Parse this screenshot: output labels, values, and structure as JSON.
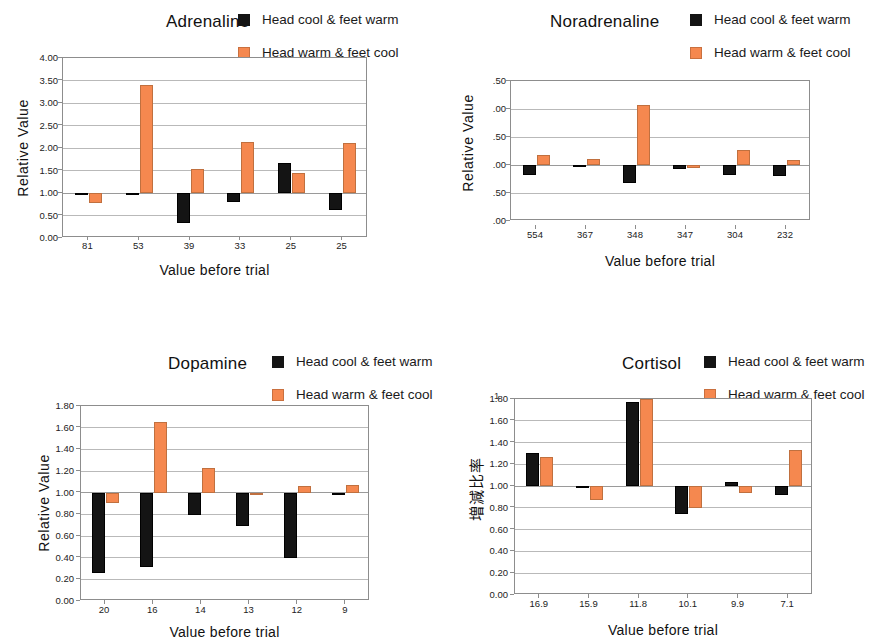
{
  "legend": {
    "series": [
      {
        "key": "dark",
        "label": "Head cool & feet warm",
        "color": "#141414"
      },
      {
        "key": "orange",
        "label": "Head warm & feet cool",
        "color": "#F5884F"
      }
    ]
  },
  "common": {
    "xlabel": "Value before trial",
    "ylabel_relative": "Relative Value",
    "ylabel_cortisol": "増減比率",
    "baseline_value": 1.0,
    "colors": {
      "dark": "#141414",
      "orange": "#F5884F",
      "grid": "#b9b9b9",
      "axis": "#8d8d8d",
      "background": "#ffffff"
    }
  },
  "panels": [
    {
      "id": "adrenaline",
      "title": "Adrenaline",
      "legend_truncated": true,
      "legend_labels": [
        "Head cool & feet warm",
        "Head warm & feet cool"
      ]
    },
    {
      "id": "noradrenaline",
      "title": "Noradrenaline",
      "legend_truncated": false,
      "legend_labels": [
        "Head cool & feet warm",
        "Head warm & feet cool"
      ]
    },
    {
      "id": "dopamine",
      "title": "Dopamine",
      "legend_truncated": true,
      "legend_labels": [
        "Head cool & feet warm",
        "Head warm & feet cool"
      ]
    },
    {
      "id": "cortisol",
      "title": "Cortisol",
      "legend_truncated": false,
      "legend_labels": [
        "Head cool & feet warm",
        "Head warm & feet cool"
      ]
    }
  ],
  "chart_data": [
    {
      "id": "adrenaline",
      "type": "bar",
      "title": "Adrenaline",
      "xlabel": "Value before trial",
      "ylabel": "Relative Value",
      "categories": [
        "81",
        "53",
        "39",
        "33",
        "25",
        "25"
      ],
      "ytick_labels": [
        "4.00",
        "3.50",
        "3.00",
        "2.50",
        "2.00",
        "1.50",
        "1.00",
        "0.50",
        "0.00"
      ],
      "ytick_values": [
        4.0,
        3.5,
        3.0,
        2.5,
        2.0,
        1.5,
        1.0,
        0.5,
        0.0
      ],
      "ylim": [
        0.0,
        4.0
      ],
      "baseline": 1.0,
      "grid": true,
      "legend_position": "top-right",
      "series": [
        {
          "name": "Head cool & feet warm",
          "color": "#141414",
          "values": [
            0.95,
            1.01,
            0.33,
            0.79,
            1.66,
            0.62
          ]
        },
        {
          "name": "Head warm & feet cool",
          "color": "#F5884F",
          "values": [
            0.77,
            3.4,
            1.53,
            2.14,
            1.44,
            2.11
          ]
        }
      ]
    },
    {
      "id": "noradrenaline",
      "type": "bar",
      "title": "Noradrenaline",
      "xlabel": "Value before trial",
      "ylabel": "Relative Value",
      "categories": [
        "554",
        "367",
        "348",
        "347",
        "304",
        "232"
      ],
      "ytick_labels": [
        ".50",
        ".00",
        ".50",
        ".00",
        ".50",
        ".00"
      ],
      "ytick_values": [
        2.5,
        2.0,
        1.5,
        1.0,
        0.5,
        0.0
      ],
      "ylim": [
        0.0,
        2.5
      ],
      "baseline": 1.0,
      "grid": true,
      "legend_position": "top-right",
      "series": [
        {
          "name": "Head cool & feet warm",
          "color": "#141414",
          "values": [
            0.83,
            0.98,
            0.67,
            0.93,
            0.82,
            0.81
          ]
        },
        {
          "name": "Head warm & feet cool",
          "color": "#F5884F",
          "values": [
            1.17,
            1.11,
            2.07,
            0.94,
            1.26,
            1.09
          ]
        }
      ]
    },
    {
      "id": "dopamine",
      "type": "bar",
      "title": "Dopamine",
      "xlabel": "Value before trial",
      "ylabel": "Relative Value",
      "categories": [
        "20",
        "16",
        "14",
        "13",
        "12",
        "9"
      ],
      "ytick_labels": [
        "1.80",
        "1.60",
        "1.40",
        "1.20",
        "1.00",
        "0.80",
        "0.60",
        "0.40",
        "0.20",
        "0.00"
      ],
      "ytick_values": [
        1.8,
        1.6,
        1.4,
        1.2,
        1.0,
        0.8,
        0.6,
        0.4,
        0.2,
        0.0
      ],
      "ylim": [
        0.0,
        1.8
      ],
      "baseline": 1.0,
      "grid": true,
      "legend_position": "top-right",
      "series": [
        {
          "name": "Head cool & feet warm",
          "color": "#141414",
          "values": [
            0.26,
            0.31,
            0.79,
            0.69,
            0.4,
            1.0
          ]
        },
        {
          "name": "Head warm & feet cool",
          "color": "#F5884F",
          "values": [
            0.9,
            1.65,
            1.23,
            1.0,
            1.06,
            1.07
          ]
        }
      ]
    },
    {
      "id": "cortisol",
      "type": "bar",
      "title": "Cortisol",
      "xlabel": "Value before trial",
      "ylabel": "増減比率",
      "categories": [
        "16.9",
        "15.9",
        "11.8",
        "10.1",
        "9.9",
        "7.1"
      ],
      "ytick_labels": [
        "1.80",
        "1.60",
        "1.40",
        "1.20",
        "1.00",
        "0.80",
        "0.60",
        "0.40",
        "0.20",
        "0.00"
      ],
      "ytick_values": [
        1.8,
        1.6,
        1.4,
        1.2,
        1.0,
        0.8,
        0.6,
        0.4,
        0.2,
        0.0
      ],
      "ylim": [
        0.0,
        1.8
      ],
      "top_nub_label": "1",
      "baseline": 1.0,
      "grid": true,
      "legend_position": "top-right",
      "series": [
        {
          "name": "Head cool & feet warm",
          "color": "#141414",
          "values": [
            1.3,
            0.99,
            1.77,
            0.74,
            1.04,
            0.92
          ]
        },
        {
          "name": "Head warm & feet cool",
          "color": "#F5884F",
          "values": [
            1.27,
            0.87,
            1.8,
            0.8,
            0.94,
            1.33
          ]
        }
      ]
    }
  ]
}
